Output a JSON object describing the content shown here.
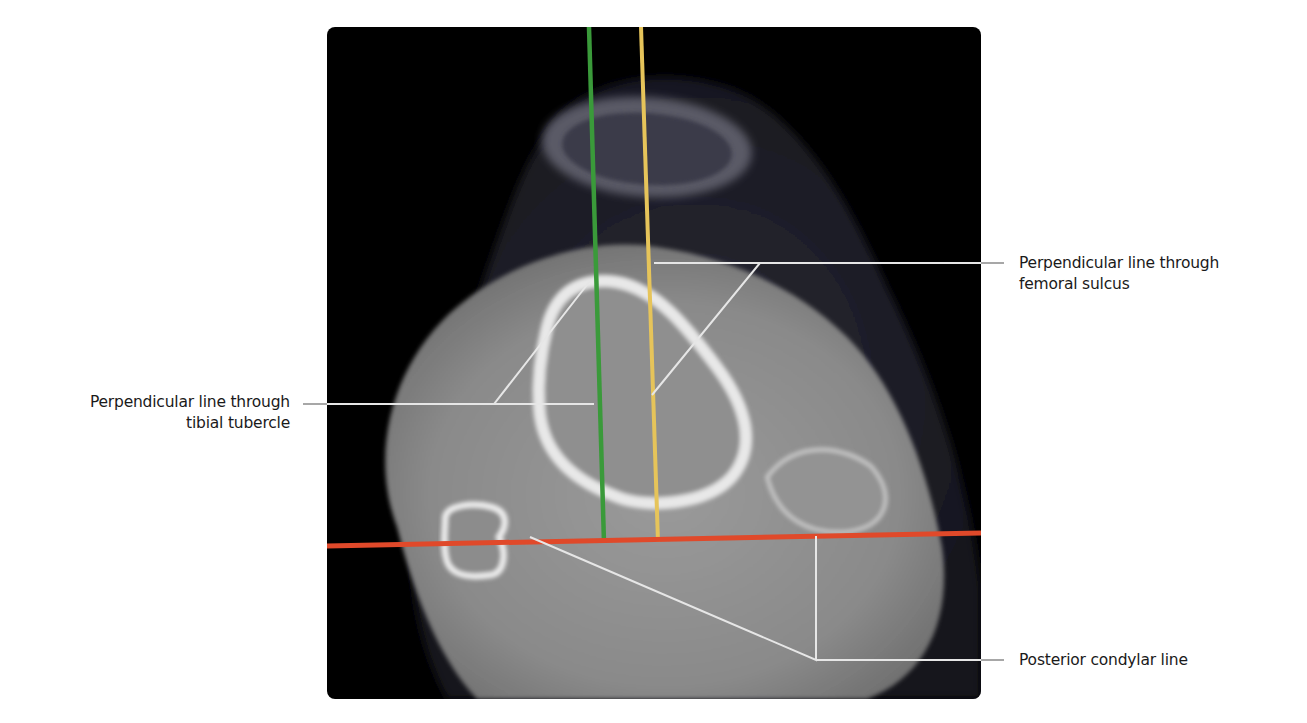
{
  "figure": {
    "type": "annotated axial CT scan of the knee",
    "colors": {
      "tibial_tubercle_line": "#3a9a3a",
      "femoral_sulcus_line": "#e6c45a",
      "posterior_condylar_line": "#e0492a",
      "leader_line": "#e8e8e8",
      "label_text": "#1a1a1a",
      "background": "#ffffff"
    },
    "labels": {
      "tibial_tubercle": {
        "line1": "Perpendicular line through",
        "line2": "tibial tubercle"
      },
      "femoral_sulcus": {
        "line1": "Perpendicular line through",
        "line2": "femoral sulcus"
      },
      "posterior_condylar": {
        "line1": "Posterior condylar line"
      }
    }
  }
}
